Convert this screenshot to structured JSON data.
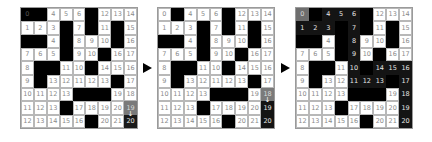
{
  "panels": [
    {
      "id": "grid-1",
      "rows": [
        [
          {
            "v": "0",
            "t": "wall-label"
          },
          {
            "v": "",
            "t": "wall"
          },
          {
            "v": "4",
            "t": "open"
          },
          {
            "v": "5",
            "t": "open"
          },
          {
            "v": "6",
            "t": "open"
          },
          {
            "v": "",
            "t": "wall"
          },
          {
            "v": "12",
            "t": "open"
          },
          {
            "v": "13",
            "t": "open"
          },
          {
            "v": "14",
            "t": "open"
          }
        ],
        [
          {
            "v": "1",
            "t": "open"
          },
          {
            "v": "2",
            "t": "open"
          },
          {
            "v": "3",
            "t": "open"
          },
          {
            "v": "",
            "t": "wall"
          },
          {
            "v": "7",
            "t": "open"
          },
          {
            "v": "",
            "t": "wall"
          },
          {
            "v": "11",
            "t": "open"
          },
          {
            "v": "",
            "t": "wall"
          },
          {
            "v": "15",
            "t": "open"
          }
        ],
        [
          {
            "v": "",
            "t": "wall"
          },
          {
            "v": "",
            "t": "wall"
          },
          {
            "v": "4",
            "t": "open"
          },
          {
            "v": "",
            "t": "wall"
          },
          {
            "v": "8",
            "t": "open"
          },
          {
            "v": "9",
            "t": "open"
          },
          {
            "v": "10",
            "t": "open"
          },
          {
            "v": "",
            "t": "wall"
          },
          {
            "v": "16",
            "t": "open"
          }
        ],
        [
          {
            "v": "7",
            "t": "open"
          },
          {
            "v": "6",
            "t": "open"
          },
          {
            "v": "5",
            "t": "open"
          },
          {
            "v": "",
            "t": "wall"
          },
          {
            "v": "9",
            "t": "open"
          },
          {
            "v": "10",
            "t": "open"
          },
          {
            "v": "",
            "t": "wall"
          },
          {
            "v": "16",
            "t": "open"
          },
          {
            "v": "17",
            "t": "open"
          }
        ],
        [
          {
            "v": "8",
            "t": "open"
          },
          {
            "v": "",
            "t": "wall"
          },
          {
            "v": "",
            "t": "wall"
          },
          {
            "v": "11",
            "t": "open"
          },
          {
            "v": "10",
            "t": "open"
          },
          {
            "v": "",
            "t": "wall"
          },
          {
            "v": "14",
            "t": "open"
          },
          {
            "v": "15",
            "t": "open"
          },
          {
            "v": "16",
            "t": "open"
          }
        ],
        [
          {
            "v": "9",
            "t": "open"
          },
          {
            "v": "",
            "t": "wall"
          },
          {
            "v": "13",
            "t": "open"
          },
          {
            "v": "12",
            "t": "open"
          },
          {
            "v": "11",
            "t": "open"
          },
          {
            "v": "12",
            "t": "open"
          },
          {
            "v": "13",
            "t": "open"
          },
          {
            "v": "",
            "t": "wall"
          },
          {
            "v": "17",
            "t": "open"
          }
        ],
        [
          {
            "v": "10",
            "t": "open"
          },
          {
            "v": "11",
            "t": "open"
          },
          {
            "v": "12",
            "t": "open"
          },
          {
            "v": "13",
            "t": "open"
          },
          {
            "v": "",
            "t": "wall"
          },
          {
            "v": "",
            "t": "wall"
          },
          {
            "v": "",
            "t": "wall"
          },
          {
            "v": "19",
            "t": "open"
          },
          {
            "v": "18",
            "t": "open"
          }
        ],
        [
          {
            "v": "11",
            "t": "open"
          },
          {
            "v": "12",
            "t": "open"
          },
          {
            "v": "13",
            "t": "open"
          },
          {
            "v": "",
            "t": "wall"
          },
          {
            "v": "17",
            "t": "open"
          },
          {
            "v": "18",
            "t": "open"
          },
          {
            "v": "19",
            "t": "open"
          },
          {
            "v": "20",
            "t": "open"
          },
          {
            "v": "19",
            "t": "current",
            "arrow": "↓"
          }
        ],
        [
          {
            "v": "12",
            "t": "open"
          },
          {
            "v": "13",
            "t": "open"
          },
          {
            "v": "14",
            "t": "open"
          },
          {
            "v": "15",
            "t": "open"
          },
          {
            "v": "16",
            "t": "open"
          },
          {
            "v": "",
            "t": "wall"
          },
          {
            "v": "20",
            "t": "open"
          },
          {
            "v": "21",
            "t": "open"
          },
          {
            "v": "20",
            "t": "goal"
          }
        ]
      ]
    },
    {
      "id": "grid-2",
      "rows": [
        [
          {
            "v": "0",
            "t": "open"
          },
          {
            "v": "",
            "t": "wall"
          },
          {
            "v": "4",
            "t": "open"
          },
          {
            "v": "5",
            "t": "open"
          },
          {
            "v": "6",
            "t": "open"
          },
          {
            "v": "",
            "t": "wall"
          },
          {
            "v": "12",
            "t": "open"
          },
          {
            "v": "13",
            "t": "open"
          },
          {
            "v": "14",
            "t": "open"
          }
        ],
        [
          {
            "v": "1",
            "t": "open"
          },
          {
            "v": "2",
            "t": "open"
          },
          {
            "v": "3",
            "t": "open"
          },
          {
            "v": "",
            "t": "wall"
          },
          {
            "v": "7",
            "t": "open"
          },
          {
            "v": "",
            "t": "wall"
          },
          {
            "v": "11",
            "t": "open"
          },
          {
            "v": "",
            "t": "wall"
          },
          {
            "v": "15",
            "t": "open"
          }
        ],
        [
          {
            "v": "",
            "t": "wall"
          },
          {
            "v": "",
            "t": "wall"
          },
          {
            "v": "4",
            "t": "open"
          },
          {
            "v": "",
            "t": "wall"
          },
          {
            "v": "8",
            "t": "open"
          },
          {
            "v": "9",
            "t": "open"
          },
          {
            "v": "10",
            "t": "open"
          },
          {
            "v": "",
            "t": "wall"
          },
          {
            "v": "16",
            "t": "open"
          }
        ],
        [
          {
            "v": "7",
            "t": "open"
          },
          {
            "v": "6",
            "t": "open"
          },
          {
            "v": "5",
            "t": "open"
          },
          {
            "v": "",
            "t": "wall"
          },
          {
            "v": "9",
            "t": "open"
          },
          {
            "v": "10",
            "t": "open"
          },
          {
            "v": "",
            "t": "wall"
          },
          {
            "v": "16",
            "t": "open"
          },
          {
            "v": "17",
            "t": "open"
          }
        ],
        [
          {
            "v": "8",
            "t": "open"
          },
          {
            "v": "",
            "t": "wall"
          },
          {
            "v": "",
            "t": "wall"
          },
          {
            "v": "11",
            "t": "open"
          },
          {
            "v": "10",
            "t": "open"
          },
          {
            "v": "",
            "t": "wall"
          },
          {
            "v": "14",
            "t": "open"
          },
          {
            "v": "15",
            "t": "open"
          },
          {
            "v": "16",
            "t": "open"
          }
        ],
        [
          {
            "v": "9",
            "t": "open"
          },
          {
            "v": "",
            "t": "wall"
          },
          {
            "v": "13",
            "t": "open"
          },
          {
            "v": "12",
            "t": "open"
          },
          {
            "v": "11",
            "t": "open"
          },
          {
            "v": "12",
            "t": "open"
          },
          {
            "v": "13",
            "t": "open"
          },
          {
            "v": "",
            "t": "wall"
          },
          {
            "v": "17",
            "t": "open"
          }
        ],
        [
          {
            "v": "10",
            "t": "open"
          },
          {
            "v": "11",
            "t": "open"
          },
          {
            "v": "12",
            "t": "open"
          },
          {
            "v": "13",
            "t": "open"
          },
          {
            "v": "",
            "t": "wall"
          },
          {
            "v": "",
            "t": "wall"
          },
          {
            "v": "",
            "t": "wall"
          },
          {
            "v": "19",
            "t": "open"
          },
          {
            "v": "18",
            "t": "current",
            "arrow": "↓"
          }
        ],
        [
          {
            "v": "11",
            "t": "open"
          },
          {
            "v": "12",
            "t": "open"
          },
          {
            "v": "13",
            "t": "open"
          },
          {
            "v": "",
            "t": "wall"
          },
          {
            "v": "17",
            "t": "open"
          },
          {
            "v": "18",
            "t": "open"
          },
          {
            "v": "19",
            "t": "open"
          },
          {
            "v": "20",
            "t": "open"
          },
          {
            "v": "19",
            "t": "path"
          }
        ],
        [
          {
            "v": "12",
            "t": "open"
          },
          {
            "v": "13",
            "t": "open"
          },
          {
            "v": "14",
            "t": "open"
          },
          {
            "v": "15",
            "t": "open"
          },
          {
            "v": "16",
            "t": "open"
          },
          {
            "v": "",
            "t": "wall"
          },
          {
            "v": "20",
            "t": "open"
          },
          {
            "v": "21",
            "t": "open"
          },
          {
            "v": "20",
            "t": "path"
          }
        ]
      ]
    },
    {
      "id": "grid-3",
      "rows": [
        [
          {
            "v": "0",
            "t": "start"
          },
          {
            "v": "",
            "t": "wall"
          },
          {
            "v": "4",
            "t": "path"
          },
          {
            "v": "5",
            "t": "path"
          },
          {
            "v": "6",
            "t": "path"
          },
          {
            "v": "",
            "t": "wall"
          },
          {
            "v": "12",
            "t": "open"
          },
          {
            "v": "13",
            "t": "open"
          },
          {
            "v": "14",
            "t": "open"
          }
        ],
        [
          {
            "v": "1",
            "t": "path"
          },
          {
            "v": "2",
            "t": "path"
          },
          {
            "v": "3",
            "t": "path"
          },
          {
            "v": "",
            "t": "wall"
          },
          {
            "v": "7",
            "t": "path"
          },
          {
            "v": "",
            "t": "wall"
          },
          {
            "v": "11",
            "t": "open"
          },
          {
            "v": "",
            "t": "wall"
          },
          {
            "v": "15",
            "t": "open"
          }
        ],
        [
          {
            "v": "",
            "t": "wall"
          },
          {
            "v": "",
            "t": "wall"
          },
          {
            "v": "4",
            "t": "open"
          },
          {
            "v": "",
            "t": "wall"
          },
          {
            "v": "8",
            "t": "path"
          },
          {
            "v": "9",
            "t": "open"
          },
          {
            "v": "10",
            "t": "open"
          },
          {
            "v": "",
            "t": "wall"
          },
          {
            "v": "16",
            "t": "open"
          }
        ],
        [
          {
            "v": "7",
            "t": "open"
          },
          {
            "v": "6",
            "t": "open"
          },
          {
            "v": "5",
            "t": "open"
          },
          {
            "v": "",
            "t": "wall"
          },
          {
            "v": "9",
            "t": "path"
          },
          {
            "v": "10",
            "t": "open"
          },
          {
            "v": "",
            "t": "wall"
          },
          {
            "v": "16",
            "t": "open"
          },
          {
            "v": "17",
            "t": "open"
          }
        ],
        [
          {
            "v": "8",
            "t": "open"
          },
          {
            "v": "",
            "t": "wall"
          },
          {
            "v": "",
            "t": "wall"
          },
          {
            "v": "11",
            "t": "open"
          },
          {
            "v": "10",
            "t": "path"
          },
          {
            "v": "",
            "t": "wall"
          },
          {
            "v": "14",
            "t": "path"
          },
          {
            "v": "15",
            "t": "path"
          },
          {
            "v": "16",
            "t": "path"
          }
        ],
        [
          {
            "v": "9",
            "t": "open"
          },
          {
            "v": "",
            "t": "wall"
          },
          {
            "v": "13",
            "t": "open"
          },
          {
            "v": "12",
            "t": "open"
          },
          {
            "v": "11",
            "t": "path"
          },
          {
            "v": "12",
            "t": "path"
          },
          {
            "v": "13",
            "t": "path"
          },
          {
            "v": "",
            "t": "wall"
          },
          {
            "v": "17",
            "t": "path"
          }
        ],
        [
          {
            "v": "10",
            "t": "open"
          },
          {
            "v": "11",
            "t": "open"
          },
          {
            "v": "12",
            "t": "open"
          },
          {
            "v": "13",
            "t": "open"
          },
          {
            "v": "",
            "t": "wall"
          },
          {
            "v": "",
            "t": "wall"
          },
          {
            "v": "",
            "t": "wall"
          },
          {
            "v": "19",
            "t": "open"
          },
          {
            "v": "18",
            "t": "path"
          }
        ],
        [
          {
            "v": "11",
            "t": "open"
          },
          {
            "v": "12",
            "t": "open"
          },
          {
            "v": "13",
            "t": "open"
          },
          {
            "v": "",
            "t": "wall"
          },
          {
            "v": "17",
            "t": "open"
          },
          {
            "v": "18",
            "t": "open"
          },
          {
            "v": "19",
            "t": "open"
          },
          {
            "v": "20",
            "t": "open"
          },
          {
            "v": "19",
            "t": "path"
          }
        ],
        [
          {
            "v": "12",
            "t": "open"
          },
          {
            "v": "13",
            "t": "open"
          },
          {
            "v": "14",
            "t": "open"
          },
          {
            "v": "15",
            "t": "open"
          },
          {
            "v": "16",
            "t": "open"
          },
          {
            "v": "",
            "t": "wall"
          },
          {
            "v": "20",
            "t": "open"
          },
          {
            "v": "21",
            "t": "open"
          },
          {
            "v": "20",
            "t": "path"
          }
        ]
      ]
    }
  ],
  "arrows": [
    "next-step",
    "next-step"
  ],
  "colors": {
    "wall": "#000000",
    "path": "#141414",
    "current": "#7a7a7a",
    "start": "#6e6e6e",
    "grid_line": "#b8b8b8",
    "number": "#8a8a8a"
  }
}
